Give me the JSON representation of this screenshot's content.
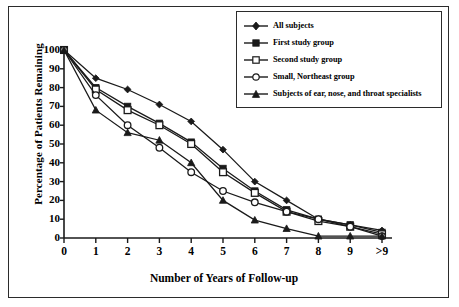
{
  "chart_data": {
    "type": "line",
    "title": "",
    "xlabel": "Number of Years of Follow-up",
    "ylabel": "Percentage of Patients Remaining",
    "categories": [
      "0",
      "1",
      "2",
      "3",
      "4",
      "5",
      "6",
      "7",
      "8",
      "9",
      ">9"
    ],
    "xticklabels": [
      "0",
      "1",
      "2",
      "3",
      "4",
      "5",
      "6",
      "7",
      "8",
      "9",
      ">9"
    ],
    "yticklabels": [
      "0",
      "10",
      "20",
      "30",
      "40",
      "50",
      "60",
      "70",
      "80",
      "90",
      "100"
    ],
    "ylim": [
      0,
      100
    ],
    "ytick_step": 10,
    "grid": false,
    "legend_position": "top-right",
    "series": [
      {
        "name": "All subjects",
        "marker": "diamond-filled",
        "values": [
          100,
          85,
          79,
          71,
          62,
          47,
          30,
          20,
          10,
          7,
          4
        ]
      },
      {
        "name": "First study group",
        "marker": "square-filled",
        "values": [
          100,
          80,
          70,
          61,
          51,
          37,
          25,
          15,
          10,
          7,
          3
        ]
      },
      {
        "name": "Second study group",
        "marker": "square-open",
        "values": [
          100,
          79,
          68,
          60,
          50,
          35,
          24,
          14,
          9,
          6,
          2
        ]
      },
      {
        "name": "Small, Northeast group",
        "marker": "circle-open",
        "values": [
          100,
          76,
          60,
          48,
          35,
          25,
          19,
          14,
          10,
          6,
          1
        ]
      },
      {
        "name": "Subjects of ear, nose, and throat specialists",
        "marker": "triangle-filled",
        "values": [
          100,
          68,
          56,
          52,
          40,
          20,
          9.5,
          5,
          1,
          1,
          1
        ]
      }
    ]
  },
  "legend": {
    "items": [
      {
        "label": "All subjects",
        "marker": "diamond-filled"
      },
      {
        "label": "First study group",
        "marker": "square-filled"
      },
      {
        "label": "Second study group",
        "marker": "square-open"
      },
      {
        "label": "Small, Northeast group",
        "marker": "circle-open"
      },
      {
        "label": "Subjects of ear, nose, and throat specialists",
        "marker": "triangle-filled"
      }
    ]
  },
  "colors": {
    "line": "#1a1a1a",
    "axis": "#1a1a1a",
    "background": "#ffffff",
    "marker_fill": "#1a1a1a",
    "marker_open_fill": "#ffffff"
  }
}
